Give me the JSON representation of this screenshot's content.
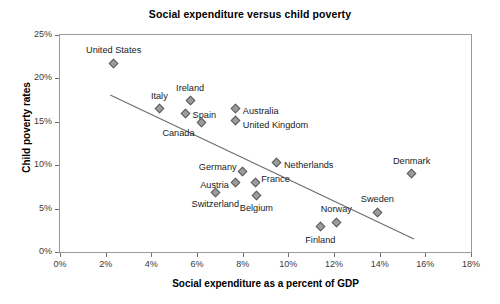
{
  "chart_data": {
    "type": "scatter",
    "title": "Social expenditure versus child poverty",
    "xlabel": "Social expenditure as a percent of GDP",
    "ylabel": "Child poverty rates",
    "xlim": [
      0,
      18
    ],
    "ylim": [
      0,
      25
    ],
    "grid": false,
    "legend": "none",
    "xticks": [
      "0%",
      "2%",
      "4%",
      "6%",
      "8%",
      "10%",
      "12%",
      "14%",
      "16%",
      "18%"
    ],
    "xtick_values": [
      0,
      2,
      4,
      6,
      8,
      10,
      12,
      14,
      16,
      18
    ],
    "yticks": [
      "0%",
      "5%",
      "10%",
      "15%",
      "20%",
      "25%"
    ],
    "ytick_values": [
      0,
      5,
      10,
      15,
      20,
      25
    ],
    "points": [
      {
        "label": "United States",
        "x": 2.35,
        "y": 21.7,
        "label_dx": 0,
        "label_dy": -13,
        "anchor": "middle"
      },
      {
        "label": "Italy",
        "x": 4.35,
        "y": 16.5,
        "label_dx": 0,
        "label_dy": -12,
        "anchor": "middle"
      },
      {
        "label": "Ireland",
        "x": 5.7,
        "y": 17.4,
        "label_dx": 0,
        "label_dy": -12,
        "anchor": "middle"
      },
      {
        "label": "Spain",
        "x": 5.5,
        "y": 16.0,
        "label_dx": 7,
        "label_dy": 3,
        "anchor": "start"
      },
      {
        "label": "Canada",
        "x": 6.2,
        "y": 14.9,
        "label_dx": -7,
        "label_dy": 11,
        "anchor": "end"
      },
      {
        "label": "Australia",
        "x": 7.7,
        "y": 16.5,
        "label_dx": 7,
        "label_dy": 3,
        "anchor": "start"
      },
      {
        "label": "United Kingdom",
        "x": 7.7,
        "y": 15.1,
        "label_dx": 7,
        "label_dy": 5,
        "anchor": "start"
      },
      {
        "label": "Germany",
        "x": 8.0,
        "y": 9.3,
        "label_dx": -6,
        "label_dy": -3,
        "anchor": "end"
      },
      {
        "label": "Netherlands",
        "x": 9.5,
        "y": 10.3,
        "label_dx": 7,
        "label_dy": 3,
        "anchor": "start"
      },
      {
        "label": "France",
        "x": 8.55,
        "y": 8.0,
        "label_dx": 6,
        "label_dy": -3,
        "anchor": "start"
      },
      {
        "label": "Austria",
        "x": 7.7,
        "y": 8.0,
        "label_dx": -7,
        "label_dy": 3,
        "anchor": "end"
      },
      {
        "label": "Switzerland",
        "x": 6.8,
        "y": 6.9,
        "label_dx": 0,
        "label_dy": 13,
        "anchor": "middle"
      },
      {
        "label": "Belgium",
        "x": 8.6,
        "y": 6.5,
        "label_dx": 0,
        "label_dy": 13,
        "anchor": "middle"
      },
      {
        "label": "Denmark",
        "x": 15.4,
        "y": 9.0,
        "label_dx": 0,
        "label_dy": -12,
        "anchor": "middle"
      },
      {
        "label": "Sweden",
        "x": 13.9,
        "y": 4.6,
        "label_dx": 0,
        "label_dy": -12,
        "anchor": "middle"
      },
      {
        "label": "Norway",
        "x": 12.1,
        "y": 3.4,
        "label_dx": 0,
        "label_dy": -12,
        "anchor": "middle"
      },
      {
        "label": "Finland",
        "x": 11.4,
        "y": 2.9,
        "label_dx": 0,
        "label_dy": 14,
        "anchor": "middle"
      }
    ],
    "trend_line": {
      "type": "linear-fit",
      "x_start": 2.2,
      "y_start": 18.1,
      "x_end": 15.5,
      "y_end": 1.5
    }
  }
}
